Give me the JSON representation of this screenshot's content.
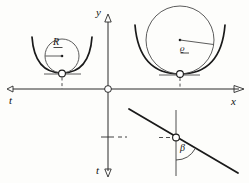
{
  "figure": {
    "kind": "geometry-diagram",
    "background": "#fdfdfb",
    "ink": "#1a1a1a",
    "width": 249,
    "height": 183
  },
  "axes": {
    "origin": {
      "x": 108,
      "y": 89
    },
    "x_axis": {
      "label": "x",
      "label_x": 232,
      "label_y": 101,
      "arrow": "right",
      "tip_x": 243,
      "y": 89,
      "start_x": 10
    },
    "y_axis": {
      "label": "y",
      "label_x": 97,
      "label_y": 12,
      "arrow": "up",
      "tip_y": 18,
      "x": 108
    },
    "t_axis_left": {
      "label": "t",
      "label_x": 11,
      "label_y": 100,
      "arrow": "left",
      "tip_x": 10,
      "y": 89
    },
    "t_axis_down": {
      "label": "t",
      "label_x": 98,
      "label_y": 171,
      "arrow": "down",
      "tip_y": 176,
      "x": 108
    },
    "origin_marker": "open-circle"
  },
  "left_figure": {
    "name": "parabola-with-circle-R",
    "label": "R",
    "label_x": 55,
    "label_y": 44,
    "label_underlined": true,
    "vertex": {
      "x": 62,
      "y": 73
    },
    "vertex_marker": "open-circle",
    "circle_center": {
      "x": 62,
      "y": 46
    },
    "circle_radius": 17,
    "radius_line_from": {
      "x": 45,
      "y": 46
    },
    "radius_line_to": {
      "x": 62,
      "y": 46
    },
    "tangent_line": {
      "x1": 44,
      "y1": 74,
      "x2": 81,
      "y2": 74
    },
    "drop_line": {
      "x": 62,
      "y1": 75,
      "y2": 89,
      "style": "dashed"
    },
    "parabola_half_width": 30,
    "parabola_height": 36
  },
  "right_figure": {
    "name": "parabola-with-circle-rho",
    "label": "ϱ",
    "label_x": 182,
    "label_y": 49,
    "label_underlined": true,
    "vertex": {
      "x": 180,
      "y": 73
    },
    "vertex_marker": "open-circle",
    "circle_center": {
      "x": 180,
      "y": 39
    },
    "circle_radius": 34,
    "radius_line_from": {
      "x": 180,
      "y": 39
    },
    "radius_line_to": {
      "x": 213,
      "y": 43
    },
    "tangent_line": {
      "x1": 159,
      "y1": 75,
      "x2": 200,
      "y2": 75
    },
    "drop_line": {
      "x": 180,
      "y1": 76,
      "y2": 89,
      "style": "dashed"
    },
    "parabola_half_width": 45,
    "parabola_height": 48
  },
  "angle_figure": {
    "name": "beta-angle",
    "label": "β",
    "label_x": 182,
    "label_y": 150,
    "point": {
      "x": 176,
      "y": 138
    },
    "point_marker": "open-circle",
    "line_from": {
      "x": 131,
      "y": 110
    },
    "line_to": {
      "x": 236,
      "y": 172
    },
    "vertical_line": {
      "x": 176,
      "y1": 112,
      "y2": 176
    },
    "dash_marker": {
      "x1": 160,
      "y1": 138,
      "x2": 172,
      "y2": 138,
      "style": "dashed"
    },
    "arc_radius": 22
  },
  "ticks": {
    "t_down_tick": {
      "x1": 102,
      "y1": 138,
      "x2": 114,
      "y2": 138
    },
    "t_down_dash": {
      "x1": 117,
      "y1": 138,
      "x2": 126,
      "y2": 138,
      "style": "dashed"
    }
  }
}
